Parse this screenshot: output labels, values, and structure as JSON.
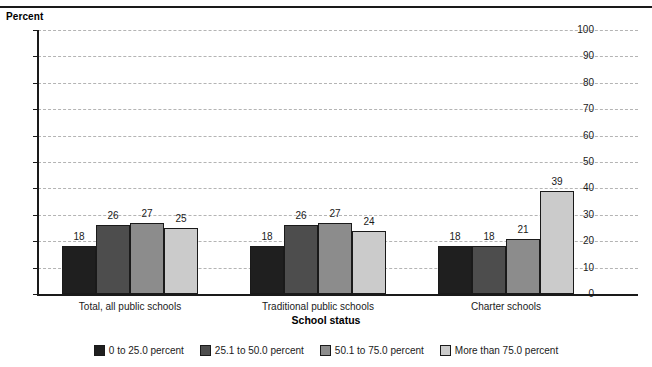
{
  "chart_data": {
    "type": "bar",
    "title": "",
    "ylabel": "Percent",
    "xlabel": "School status",
    "categories": [
      "Total, all public schools",
      "Traditional public schools",
      "Charter schools"
    ],
    "series": [
      {
        "name": "0 to 25.0 percent",
        "color": "#1f1f1f",
        "values": [
          18,
          18,
          18
        ]
      },
      {
        "name": "25.1 to 50.0 percent",
        "color": "#4d4d4d",
        "values": [
          26,
          26,
          18
        ]
      },
      {
        "name": "50.1 to 75.0 percent",
        "color": "#8c8c8c",
        "values": [
          27,
          27,
          21
        ]
      },
      {
        "name": "More than 75.0 percent",
        "color": "#cbcbcb",
        "values": [
          25,
          24,
          39
        ]
      }
    ],
    "ylim": [
      0,
      100
    ],
    "ytick_step": 10,
    "yticks": [
      "0",
      "10",
      "20",
      "30",
      "40",
      "50",
      "60",
      "70",
      "80",
      "90",
      "100"
    ],
    "grid": true,
    "grid_style": "dashed",
    "legend_position": "bottom"
  },
  "axis": {
    "y_title": "Percent",
    "x_title": "School status"
  },
  "legend": {
    "items": [
      {
        "label": "0 to 25.0 percent",
        "color": "#1f1f1f"
      },
      {
        "label": "25.1 to 50.0 percent",
        "color": "#4d4d4d"
      },
      {
        "label": "50.1 to 75.0 percent",
        "color": "#8c8c8c"
      },
      {
        "label": "More than 75.0 percent",
        "color": "#cbcbcb"
      }
    ]
  }
}
